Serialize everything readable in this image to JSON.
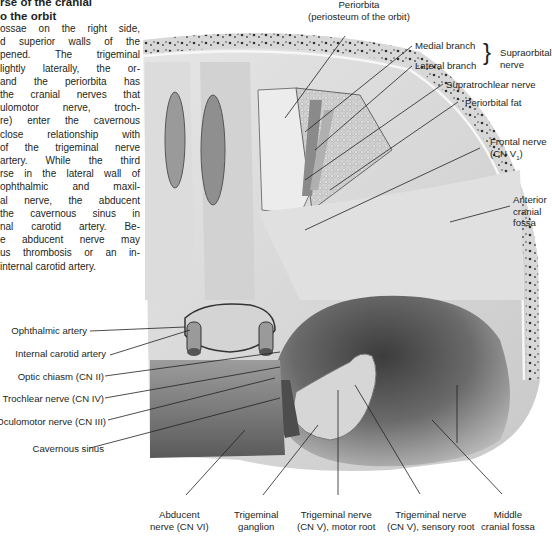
{
  "text_block": {
    "heading_lines": [
      "rse of the cranial",
      "o the orbit"
    ],
    "paragraph_lines": [
      "ossae on the right side,",
      "d superior walls of the",
      "pened. The trigeminal",
      "lightly laterally, the or-",
      " and the periorbita has",
      " the cranial nerves that",
      "ulomotor nerve, troch-",
      "re) enter the cavernous",
      " close relationship with",
      " of the trigeminal nerve",
      " artery. While the third",
      "rse in the lateral wall of",
      " ophthalmic and maxil-",
      "al nerve, the abducent",
      " the cavernous sinus in",
      "nal carotid artery. Be-",
      "e abducent nerve may",
      "us thrombosis or an in-",
      " internal carotid artery."
    ]
  },
  "figure": {
    "colors": {
      "bone": "#d9d9d9",
      "bone_light": "#eeeeee",
      "diploe_spots": "#3a3a3a",
      "fossa_dark": "#4a4a4a",
      "leader_line": "#231f20"
    },
    "labels_top": {
      "periorbita": [
        "Periorbita",
        "(periosteum of the orbit)"
      ],
      "medial_branch": "Medial branch",
      "lateral_branch": "Lateral branch",
      "supraorbital_nerve": [
        "Supraorbital",
        "nerve"
      ],
      "supratrochlear_nerve": "Supratrochlear nerve",
      "periorbital_fat": "Periorbital fat",
      "frontal_nerve": [
        "Frontal nerve",
        "(CN V",
        "1",
        ")"
      ],
      "anterior_cranial_fossa": [
        "Anterior",
        "cranial",
        "fossa"
      ]
    },
    "labels_left": {
      "ophthalmic_artery": "Ophthalmic artery",
      "internal_carotid_artery": "Internal carotid artery",
      "optic_chiasm": "Optic chiasm (CN II)",
      "trochlear_nerve": "Trochlear nerve (CN IV)",
      "oculomotor_nerve": "Oculomotor nerve (CN III)",
      "cavernous_sinus": "Cavernous sinus"
    },
    "labels_bottom": {
      "abducent_nerve": [
        "Abducent",
        "nerve (CN VI)"
      ],
      "trigeminal_ganglion": [
        "Trigeminal",
        "ganglion"
      ],
      "trigeminal_motor_root": [
        "Trigeminal nerve",
        "(CN V), motor root"
      ],
      "trigeminal_sensory_root": [
        "Trigeminal nerve",
        "(CN V), sensory root"
      ],
      "middle_cranial_fossa": [
        "Middle",
        "cranial fossa"
      ]
    }
  }
}
